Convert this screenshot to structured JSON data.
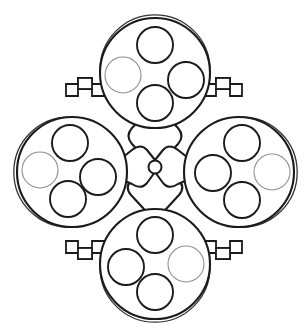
{
  "figure": {
    "background_color": "#ffffff",
    "line_color": "#1b1b1b",
    "fill_color": "#ffffff",
    "highlight_color": "#9a9a9a",
    "width": 308,
    "height": 331
  },
  "hub": {
    "name": "central-cross-plate",
    "center": {
      "x": 155,
      "y": 167
    },
    "pivot_radius": 6.5,
    "arm_count": 4
  },
  "drums": [
    {
      "id": "drum-top",
      "position": "top",
      "center": {
        "x": 155,
        "y": 73
      },
      "radius": 55,
      "bores": [
        {
          "id": "bore-top-1",
          "cx": 155,
          "cy": 45,
          "r": 18,
          "filled": false
        },
        {
          "id": "bore-top-2",
          "cx": 186,
          "cy": 80,
          "r": 18,
          "filled": false
        },
        {
          "id": "bore-top-3",
          "cx": 155,
          "cy": 103,
          "r": 18,
          "filled": false
        },
        {
          "id": "bore-top-4",
          "cx": 123,
          "cy": 75,
          "r": 18,
          "filled": true
        }
      ]
    },
    {
      "id": "drum-left",
      "position": "left",
      "center": {
        "x": 72,
        "y": 172
      },
      "radius": 55,
      "bores": [
        {
          "id": "bore-left-1",
          "cx": 70,
          "cy": 143,
          "r": 18,
          "filled": false
        },
        {
          "id": "bore-left-2",
          "cx": 98,
          "cy": 177,
          "r": 18,
          "filled": false
        },
        {
          "id": "bore-left-3",
          "cx": 68,
          "cy": 199,
          "r": 18,
          "filled": false
        },
        {
          "id": "bore-left-4",
          "cx": 40,
          "cy": 170,
          "r": 18,
          "filled": true
        }
      ]
    },
    {
      "id": "drum-right",
      "position": "right",
      "center": {
        "x": 239,
        "y": 172
      },
      "radius": 55,
      "bores": [
        {
          "id": "bore-right-1",
          "cx": 242,
          "cy": 143,
          "r": 18,
          "filled": false
        },
        {
          "id": "bore-right-2",
          "cx": 213,
          "cy": 173,
          "r": 18,
          "filled": false
        },
        {
          "id": "bore-right-3",
          "cx": 242,
          "cy": 200,
          "r": 18,
          "filled": false
        },
        {
          "id": "bore-right-4",
          "cx": 272,
          "cy": 172,
          "r": 18,
          "filled": true
        }
      ]
    },
    {
      "id": "drum-bottom",
      "position": "bottom",
      "center": {
        "x": 155,
        "y": 264
      },
      "radius": 55,
      "bores": [
        {
          "id": "bore-bottom-1",
          "cx": 155,
          "cy": 235,
          "r": 18,
          "filled": false
        },
        {
          "id": "bore-bottom-2",
          "cx": 126,
          "cy": 267,
          "r": 18,
          "filled": false
        },
        {
          "id": "bore-bottom-3",
          "cx": 155,
          "cy": 292,
          "r": 18,
          "filled": false
        },
        {
          "id": "bore-bottom-4",
          "cx": 186,
          "cy": 264,
          "r": 18,
          "filled": true
        }
      ]
    }
  ],
  "brackets": [
    {
      "id": "bracket-top-left",
      "quadrant": "top-left"
    },
    {
      "id": "bracket-top-right",
      "quadrant": "top-right"
    },
    {
      "id": "bracket-bottom-left",
      "quadrant": "bottom-left"
    },
    {
      "id": "bracket-bottom-right",
      "quadrant": "bottom-right"
    }
  ]
}
